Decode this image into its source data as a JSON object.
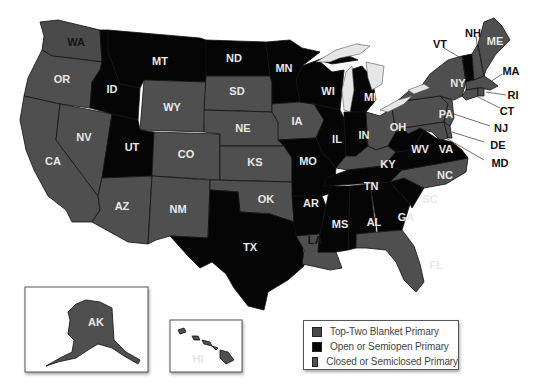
{
  "legend": {
    "items": [
      {
        "key": "top_two",
        "label": "Top-Two Blanket Primary",
        "color": "#4a4a4a"
      },
      {
        "key": "open",
        "label": "Open or Semiopen Primary",
        "color": "#050505"
      },
      {
        "key": "closed",
        "label": "Closed or Semiclosed Primary",
        "color": "#505050"
      }
    ]
  },
  "colors": {
    "top_two": "#4a4a4a",
    "open": "#050505",
    "closed": "#4f4f4f",
    "lakes": "#e6e6e6",
    "background": "#ffffff"
  },
  "states": {
    "WA": {
      "label": "WA",
      "category": "top_two"
    },
    "OR": {
      "label": "OR",
      "category": "closed"
    },
    "CA": {
      "label": "CA",
      "category": "closed"
    },
    "NV": {
      "label": "NV",
      "category": "closed"
    },
    "ID": {
      "label": "ID",
      "category": "open"
    },
    "MT": {
      "label": "MT",
      "category": "open"
    },
    "WY": {
      "label": "WY",
      "category": "closed"
    },
    "UT": {
      "label": "UT",
      "category": "open"
    },
    "CO": {
      "label": "CO",
      "category": "closed"
    },
    "AZ": {
      "label": "AZ",
      "category": "closed"
    },
    "NM": {
      "label": "NM",
      "category": "closed"
    },
    "ND": {
      "label": "ND",
      "category": "open"
    },
    "SD": {
      "label": "SD",
      "category": "closed"
    },
    "NE": {
      "label": "NE",
      "category": "closed"
    },
    "KS": {
      "label": "KS",
      "category": "closed"
    },
    "OK": {
      "label": "OK",
      "category": "closed"
    },
    "TX": {
      "label": "TX",
      "category": "open"
    },
    "MN": {
      "label": "MN",
      "category": "open"
    },
    "IA": {
      "label": "IA",
      "category": "closed"
    },
    "MO": {
      "label": "MO",
      "category": "open"
    },
    "AR": {
      "label": "AR",
      "category": "open"
    },
    "LA": {
      "label": "LA",
      "category": "closed"
    },
    "WI": {
      "label": "WI",
      "category": "open"
    },
    "IL": {
      "label": "IL",
      "category": "open"
    },
    "MI": {
      "label": "MI",
      "category": "open"
    },
    "IN": {
      "label": "IN",
      "category": "open"
    },
    "OH": {
      "label": "OH",
      "category": "closed"
    },
    "KY": {
      "label": "KY",
      "category": "closed"
    },
    "TN": {
      "label": "TN",
      "category": "open"
    },
    "MS": {
      "label": "MS",
      "category": "open"
    },
    "AL": {
      "label": "AL",
      "category": "open"
    },
    "GA": {
      "label": "GA",
      "category": "open"
    },
    "FL": {
      "label": "FL",
      "category": "closed"
    },
    "SC": {
      "label": "SC",
      "category": "open"
    },
    "NC": {
      "label": "NC",
      "category": "closed"
    },
    "VA": {
      "label": "VA",
      "category": "open"
    },
    "WV": {
      "label": "WV",
      "category": "open"
    },
    "PA": {
      "label": "PA",
      "category": "closed"
    },
    "NY": {
      "label": "NY",
      "category": "closed"
    },
    "VT": {
      "label": "VT",
      "category": "open"
    },
    "NH": {
      "label": "NH",
      "category": "closed"
    },
    "ME": {
      "label": "ME",
      "category": "closed"
    },
    "MA": {
      "label": "MA",
      "category": "closed"
    },
    "RI": {
      "label": "RI",
      "category": "closed"
    },
    "CT": {
      "label": "CT",
      "category": "closed"
    },
    "NJ": {
      "label": "NJ",
      "category": "closed"
    },
    "DE": {
      "label": "DE",
      "category": "closed"
    },
    "MD": {
      "label": "MD",
      "category": "closed"
    },
    "AK": {
      "label": "AK",
      "category": "closed"
    },
    "HI": {
      "label": "HI",
      "category": "closed"
    }
  }
}
